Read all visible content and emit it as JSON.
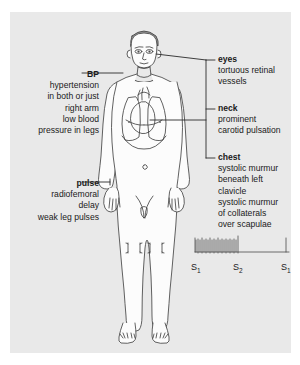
{
  "figure": {
    "name": "clinical-signs-body-diagram",
    "background_color": "#e9e9e9",
    "ink_color": "#333333",
    "page_background": "#ffffff"
  },
  "callouts": {
    "bp": {
      "heading": "BP",
      "lines": [
        "hypertension",
        "in both or just",
        "right arm",
        "low blood",
        "pressure in legs"
      ]
    },
    "pulse": {
      "heading": "pulse",
      "lines": [
        "radiofemoral",
        "delay",
        "weak leg pulses"
      ]
    },
    "eyes": {
      "heading": "eyes",
      "lines": [
        "tortuous retinal",
        "vessels"
      ]
    },
    "neck": {
      "heading": "neck",
      "lines": [
        "prominent",
        "carotid pulsation"
      ]
    },
    "chest": {
      "heading": "chest",
      "lines": [
        "systolic murmur",
        "beneath left",
        "clavicle",
        "systolic murmur",
        "of collaterals",
        "over scapulae"
      ]
    }
  },
  "phonocardiogram": {
    "name": "heart-sound-tracing",
    "heart_sounds": [
      {
        "label": "S",
        "subscript": "1"
      },
      {
        "label": "S",
        "subscript": "2"
      },
      {
        "label": "S",
        "subscript": "1"
      }
    ],
    "murmur_description": "systolic murmur spikes between S1 and S2",
    "murmur_spike_count": 22
  }
}
